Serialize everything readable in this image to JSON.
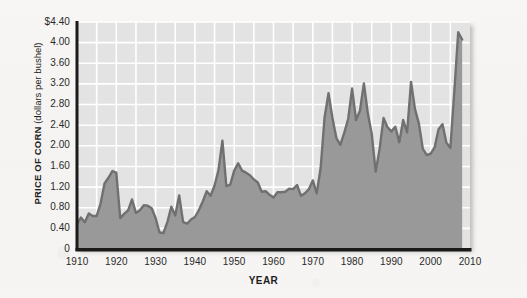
{
  "chart_data": {
    "type": "area",
    "title": "",
    "xlabel": "YEAR",
    "ylabel": "PRICE OF CORN (dollars per bushel)",
    "ylabel_bold_part": "PRICE OF CORN",
    "ylabel_plain_part": "(dollars per bushel)",
    "xlim": [
      1910,
      2010
    ],
    "ylim": [
      0,
      4.4
    ],
    "grid": true,
    "legend": "none",
    "y_ticks": [
      0,
      0.4,
      0.8,
      1.2,
      1.6,
      2.0,
      2.4,
      2.8,
      3.2,
      3.6,
      4.0,
      4.4
    ],
    "y_tick_labels": [
      "0",
      "0.40",
      "0.80",
      "1.20",
      "1.60",
      "2.00",
      "2.40",
      "2.80",
      "3.20",
      "3.60",
      "4.00",
      "$4.40"
    ],
    "x_ticks": [
      1910,
      1920,
      1930,
      1940,
      1950,
      1960,
      1970,
      1980,
      1990,
      2000,
      2010
    ],
    "x_tick_labels": [
      "1910",
      "1920",
      "1930",
      "1940",
      "1950",
      "1960",
      "1970",
      "1980",
      "1990",
      "2000",
      "2010"
    ],
    "x_minor_step": 5,
    "series_name": "Price of corn",
    "x": [
      1910,
      1911,
      1912,
      1913,
      1914,
      1915,
      1916,
      1917,
      1918,
      1919,
      1920,
      1921,
      1922,
      1923,
      1924,
      1925,
      1926,
      1927,
      1928,
      1929,
      1930,
      1931,
      1932,
      1933,
      1934,
      1935,
      1936,
      1937,
      1938,
      1939,
      1940,
      1941,
      1942,
      1943,
      1944,
      1945,
      1946,
      1947,
      1948,
      1949,
      1950,
      1951,
      1952,
      1953,
      1954,
      1955,
      1956,
      1957,
      1958,
      1959,
      1960,
      1961,
      1962,
      1963,
      1964,
      1965,
      1966,
      1967,
      1968,
      1969,
      1970,
      1971,
      1972,
      1973,
      1974,
      1975,
      1976,
      1977,
      1978,
      1979,
      1980,
      1981,
      1982,
      1983,
      1984,
      1985,
      1986,
      1987,
      1988,
      1989,
      1990,
      1991,
      1992,
      1993,
      1994,
      1995,
      1996,
      1997,
      1998,
      1999,
      2000,
      2001,
      2002,
      2003,
      2004,
      2005,
      2006,
      2007,
      2008
    ],
    "values": [
      0.48,
      0.61,
      0.52,
      0.69,
      0.64,
      0.64,
      0.88,
      1.27,
      1.38,
      1.51,
      1.48,
      0.6,
      0.68,
      0.75,
      0.96,
      0.7,
      0.75,
      0.85,
      0.84,
      0.79,
      0.6,
      0.32,
      0.31,
      0.52,
      0.82,
      0.65,
      1.04,
      0.52,
      0.49,
      0.57,
      0.62,
      0.75,
      0.92,
      1.12,
      1.03,
      1.23,
      1.53,
      2.1,
      1.22,
      1.25,
      1.52,
      1.66,
      1.52,
      1.48,
      1.43,
      1.35,
      1.29,
      1.11,
      1.12,
      1.05,
      1.0,
      1.1,
      1.1,
      1.11,
      1.17,
      1.16,
      1.24,
      1.03,
      1.08,
      1.16,
      1.33,
      1.08,
      1.57,
      2.55,
      3.02,
      2.54,
      2.15,
      2.02,
      2.25,
      2.52,
      3.11,
      2.5,
      2.68,
      3.21,
      2.63,
      2.23,
      1.5,
      1.94,
      2.54,
      2.36,
      2.28,
      2.37,
      2.07,
      2.5,
      2.26,
      3.24,
      2.71,
      2.43,
      1.94,
      1.82,
      1.85,
      1.97,
      2.32,
      2.42,
      2.06,
      1.96,
      3.04,
      4.2,
      4.06
    ]
  },
  "colors": {
    "page_background": "#f6f5f3",
    "plot_background": "#e3e3e3",
    "area_fill": "#999999",
    "line_stroke": "#707070",
    "gridline": "#ffffff",
    "axis_spine": "#1a1a1a",
    "tick_text": "#2a2a2a"
  }
}
